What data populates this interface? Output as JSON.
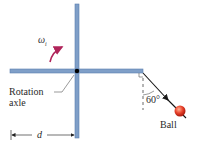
{
  "diagram": {
    "type": "physics-rotation",
    "labels": {
      "omega": "ω",
      "omega_sub": "i",
      "rotation_axle": "Rotation",
      "rotation_axle_line2": "axle",
      "angle": "60°",
      "ball": "Ball",
      "distance": "d"
    },
    "colors": {
      "rod": "#7f9fc8",
      "rod_edge": "#5b7fb0",
      "axle_dot": "#000000",
      "omega_arrow": "#b0245a",
      "ball": "#e8402a",
      "text": "#2a2a2a"
    },
    "angle_deg": 60
  }
}
